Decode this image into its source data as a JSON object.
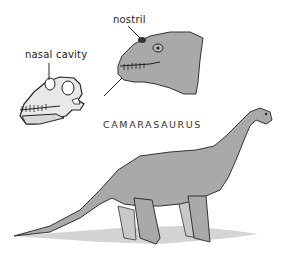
{
  "figure": {
    "title": "CAMARASAURUS",
    "labels": {
      "nasal_cavity": "nasal cavity",
      "nostril": "nostril"
    },
    "colors": {
      "ink": "#222222",
      "skin": "#a9a9a9",
      "skin_light": "#c8c8c8",
      "shadow": "#d4d4d4",
      "background": "#ffffff"
    }
  }
}
